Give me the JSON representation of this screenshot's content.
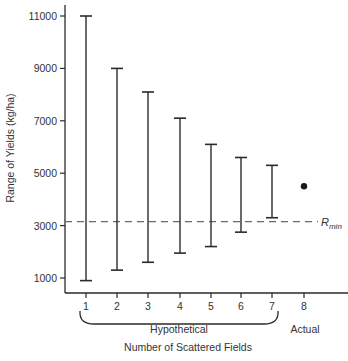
{
  "chart_data": {
    "type": "range",
    "title": "",
    "xlabel": "Number of Scattered Fields",
    "ylabel": "Range of Yields (kg/ha)",
    "ylim": [
      500,
      11500
    ],
    "yticks": [
      1000,
      3000,
      5000,
      7000,
      9000,
      11000
    ],
    "ytick_labels": [
      "1000",
      "3000",
      "5000",
      "7000",
      "9000",
      "11000"
    ],
    "categories": [
      "1",
      "2",
      "3",
      "4",
      "5",
      "6",
      "7",
      "8"
    ],
    "series": [
      {
        "name": "Hypothetical",
        "type": "range-bar",
        "x": [
          1,
          2,
          3,
          4,
          5,
          6,
          7
        ],
        "low": [
          900,
          1300,
          1600,
          1950,
          2200,
          2750,
          3300
        ],
        "high": [
          11000,
          9000,
          8100,
          7100,
          6100,
          5600,
          5300
        ]
      },
      {
        "name": "Actual",
        "type": "point",
        "x": [
          8
        ],
        "values": [
          4500
        ]
      }
    ],
    "reference_lines": [
      {
        "label": "R",
        "subscript": "min",
        "value": 3150,
        "style": "dashed"
      }
    ],
    "group_labels": [
      {
        "label": "Hypothetical",
        "from": 1,
        "to": 7,
        "bracket": true
      },
      {
        "label": "Actual",
        "from": 8,
        "to": 8,
        "bracket": false
      }
    ],
    "grid": false,
    "legend": null
  },
  "labels": {
    "ylabel": "Range of Yields (kg/ha)",
    "xlabel": "Number of Scattered Fields",
    "hypothetical": "Hypothetical",
    "actual": "Actual",
    "rmin_main": "R",
    "rmin_sub": "min"
  },
  "colors": {
    "line": "#2b2b2b",
    "dash": "#6a6a6a",
    "text": "#333333"
  }
}
